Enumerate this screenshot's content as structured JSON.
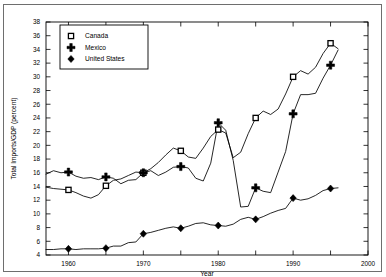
{
  "chart_data": {
    "type": "line",
    "title": "",
    "xlabel": "Year",
    "ylabel": "Total Imports/GDP (percent)",
    "xlim": [
      1957,
      2000
    ],
    "ylim": [
      4,
      38
    ],
    "xticks": [
      1960,
      1965,
      1970,
      1975,
      1980,
      1985,
      1990,
      1995,
      2000
    ],
    "xtick_labels": [
      "1960",
      "",
      "1970",
      "",
      "1980",
      "",
      "1990",
      "",
      "2000"
    ],
    "yticks": [
      4,
      6,
      8,
      10,
      12,
      14,
      16,
      18,
      20,
      22,
      24,
      26,
      28,
      30,
      32,
      34,
      36,
      38
    ],
    "ytick_labels": [
      "4",
      "6",
      "8",
      "10",
      "12",
      "14",
      "16",
      "18",
      "20",
      "22",
      "24",
      "26",
      "28",
      "30",
      "32",
      "34",
      "36",
      "38"
    ],
    "grid": false,
    "legend_position": "upper-left-inside",
    "marker_years": [
      1960,
      1965,
      1970,
      1975,
      1980,
      1985,
      1990,
      1995
    ],
    "series": [
      {
        "name": "Canada",
        "marker": "open-square",
        "color": "#000000",
        "x": [
          1957,
          1958,
          1959,
          1960,
          1961,
          1962,
          1963,
          1964,
          1965,
          1966,
          1967,
          1968,
          1969,
          1970,
          1971,
          1972,
          1973,
          1974,
          1975,
          1976,
          1977,
          1978,
          1979,
          1980,
          1981,
          1982,
          1983,
          1984,
          1985,
          1986,
          1987,
          1988,
          1989,
          1990,
          1991,
          1992,
          1993,
          1994,
          1995,
          1996
        ],
        "values": [
          13.9,
          13.7,
          13.6,
          13.5,
          13.1,
          12.6,
          12.3,
          12.8,
          14.1,
          14.9,
          15.1,
          15.6,
          16.1,
          16.0,
          16.6,
          17.5,
          18.6,
          19.6,
          19.2,
          18.3,
          18.1,
          19.6,
          21.3,
          22.3,
          21.8,
          18.2,
          19.0,
          21.7,
          24.0,
          25.0,
          24.5,
          25.3,
          27.5,
          30.0,
          30.9,
          30.4,
          31.4,
          33.4,
          34.9,
          34.1
        ]
      },
      {
        "name": "Mexico",
        "marker": "plus",
        "color": "#000000",
        "x": [
          1957,
          1958,
          1959,
          1960,
          1961,
          1962,
          1963,
          1964,
          1965,
          1966,
          1967,
          1968,
          1969,
          1970,
          1971,
          1972,
          1973,
          1974,
          1975,
          1976,
          1977,
          1978,
          1979,
          1980,
          1981,
          1982,
          1983,
          1984,
          1985,
          1986,
          1987,
          1988,
          1989,
          1990,
          1991,
          1992,
          1993,
          1994,
          1995,
          1996
        ],
        "values": [
          15.8,
          16.3,
          16.0,
          16.1,
          15.5,
          15.2,
          15.3,
          15.0,
          15.4,
          15.2,
          14.4,
          14.9,
          15.0,
          16.0,
          16.3,
          15.6,
          16.1,
          16.8,
          16.9,
          16.7,
          15.2,
          14.8,
          17.4,
          23.3,
          22.2,
          17.8,
          11.0,
          11.1,
          13.8,
          13.3,
          13.1,
          16.1,
          19.1,
          24.6,
          27.4,
          27.4,
          27.6,
          29.8,
          31.7,
          33.9
        ]
      },
      {
        "name": "United States",
        "marker": "filled-diamond",
        "color": "#000000",
        "x": [
          1957,
          1958,
          1959,
          1960,
          1961,
          1962,
          1963,
          1964,
          1965,
          1966,
          1967,
          1968,
          1969,
          1970,
          1971,
          1972,
          1973,
          1974,
          1975,
          1976,
          1977,
          1978,
          1979,
          1980,
          1981,
          1982,
          1983,
          1984,
          1985,
          1986,
          1987,
          1988,
          1989,
          1990,
          1991,
          1992,
          1993,
          1994,
          1995,
          1996
        ],
        "values": [
          4.8,
          4.8,
          4.9,
          4.9,
          4.8,
          4.9,
          4.9,
          4.9,
          5.0,
          5.3,
          5.3,
          5.8,
          5.9,
          7.1,
          7.3,
          7.6,
          7.9,
          8.1,
          7.9,
          8.2,
          8.6,
          8.7,
          8.4,
          8.3,
          8.2,
          8.5,
          9.2,
          9.5,
          9.2,
          9.6,
          10.1,
          10.5,
          10.8,
          12.3,
          12.0,
          12.2,
          12.7,
          13.4,
          13.7,
          13.8
        ]
      }
    ],
    "legend_entries": [
      {
        "label": "Canada",
        "marker": "open-square"
      },
      {
        "label": "Mexico",
        "marker": "plus"
      },
      {
        "label": "United States",
        "marker": "filled-diamond"
      }
    ]
  }
}
